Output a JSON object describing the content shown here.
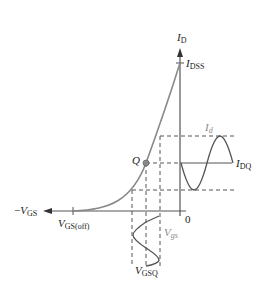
{
  "diagram": {
    "labels": {
      "id_axis": {
        "main": "I",
        "sub": "D"
      },
      "idss": {
        "main": "I",
        "sub": "DSS"
      },
      "id_signal": {
        "main": "I",
        "sub": "d"
      },
      "idq": {
        "main": "I",
        "sub": "DQ"
      },
      "q_point": "Q",
      "neg_vgs": {
        "prefix": "−",
        "main": "V",
        "sub": "GS"
      },
      "vgs_off": {
        "main": "V",
        "sub": "GS(off)"
      },
      "zero": "0",
      "vgs_signal": {
        "main": "V",
        "sub": "gs"
      },
      "vgsq": {
        "main": "V",
        "sub": "GSQ"
      }
    },
    "colors": {
      "axis": "#555555",
      "curve": "#8a8a8a",
      "dashed": "#555555",
      "signal": "#555555",
      "q_point": "#8a8a8a",
      "signal_label": "#8a8a8a"
    }
  }
}
